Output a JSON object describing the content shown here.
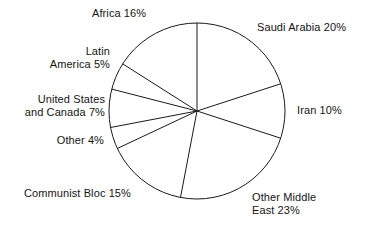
{
  "chart_data": {
    "type": "pie",
    "title": "",
    "subtitle": "",
    "xlabel": "",
    "ylabel": "",
    "legend_position": "none",
    "grid": false,
    "units": "percent",
    "start_angle_deg": 0,
    "direction": "clockwise",
    "categories": [
      "Saudi Arabia",
      "Iran",
      "Other Middle East",
      "Communist Bloc",
      "Other",
      "United States and Canada",
      "Latin America",
      "Africa"
    ],
    "values": [
      20,
      10,
      23,
      15,
      4,
      7,
      5,
      16
    ],
    "total": 100,
    "slices": [
      {
        "name": "Saudi Arabia",
        "value": 20,
        "label": "Saudi Arabia 20%",
        "angle_deg": 72.0
      },
      {
        "name": "Iran",
        "value": 10,
        "label": "Iran 10%",
        "angle_deg": 36.0
      },
      {
        "name": "Other Middle East",
        "value": 23,
        "label": "Other Middle\nEast 23%",
        "angle_deg": 82.8
      },
      {
        "name": "Communist Bloc",
        "value": 15,
        "label": "Communist Bloc 15%",
        "angle_deg": 54.0
      },
      {
        "name": "Other",
        "value": 4,
        "label": "Other 4%",
        "angle_deg": 14.4
      },
      {
        "name": "United States and Canada",
        "value": 7,
        "label": "United States\nand Canada 7%",
        "angle_deg": 25.2
      },
      {
        "name": "Latin America",
        "value": 5,
        "label": "Latin\nAmerica 5%",
        "angle_deg": 18.0
      },
      {
        "name": "Africa",
        "value": 16,
        "label": "Africa 16%",
        "angle_deg": 57.6
      }
    ],
    "style": {
      "fill": "#ffffff",
      "stroke": "#1a1a1a",
      "stroke_width": 1,
      "text_color": "#141414"
    },
    "geometry": {
      "center_x": 197,
      "center_y": 111,
      "radius": 88
    }
  },
  "labels": {
    "saudi": "Saudi Arabia 20%",
    "iran": "Iran 10%",
    "other_middle_east": "Other Middle\nEast 23%",
    "communist_bloc": "Communist Bloc 15%",
    "other": "Other 4%",
    "us_canada": "United States\nand Canada 7%",
    "latin_america": "Latin\nAmerica 5%",
    "africa": "Africa 16%"
  }
}
